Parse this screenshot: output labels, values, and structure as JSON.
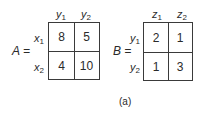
{
  "matrices": [
    {
      "name": "A",
      "label": "A =",
      "col_headers": [
        {
          "base": "y",
          "sub": "1"
        },
        {
          "base": "y",
          "sub": "2"
        }
      ],
      "row_headers": [
        {
          "base": "x",
          "sub": "1"
        },
        {
          "base": "x",
          "sub": "2"
        }
      ],
      "cells": [
        [
          "8",
          "5"
        ],
        [
          "4",
          "10"
        ]
      ]
    },
    {
      "name": "B",
      "label": "B =",
      "col_headers": [
        {
          "base": "z",
          "sub": "1"
        },
        {
          "base": "z",
          "sub": "2"
        }
      ],
      "row_headers": [
        {
          "base": "y",
          "sub": "1"
        },
        {
          "base": "y",
          "sub": "2"
        }
      ],
      "cells": [
        [
          "2",
          "1"
        ],
        [
          "1",
          "3"
        ]
      ]
    }
  ],
  "caption": "(a)"
}
